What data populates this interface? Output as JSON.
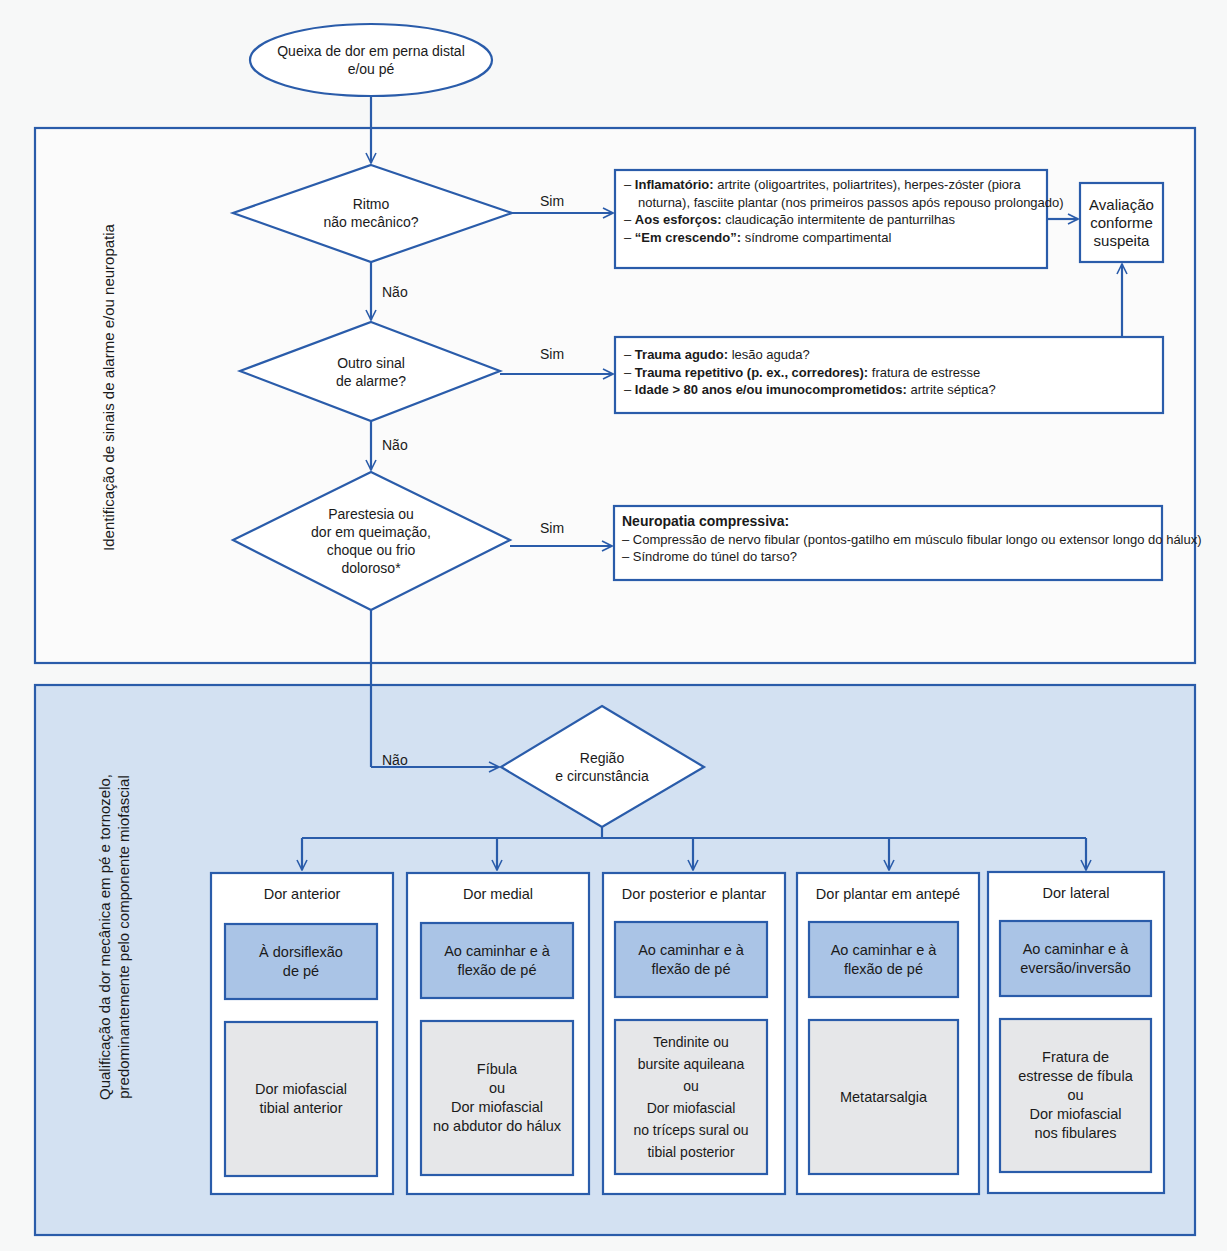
{
  "colors": {
    "line": "#2a5caa",
    "bottom_section_fill": "#d3e1f2",
    "mid_box_fill": "#aac4e6",
    "low_box_fill": "#e6e7e9",
    "background": "#f7f8f8"
  },
  "start": {
    "text_line1": "Queixa de dor em perna distal",
    "text_line2": "e/ou pé"
  },
  "alarm_section": {
    "vertical_label": "Identificação de sinais de alarme e/ou neuropatia",
    "decision1": {
      "line1": "Ritmo",
      "line2": "não mecânico?",
      "yes": "Sim",
      "no": "Não"
    },
    "result1": {
      "items": [
        {
          "bold": "Inflamatório:",
          "text": " artrite (oligoartrites, poliartrites), herpes-zóster (piora",
          "cont": "noturna), fasciite plantar (nos primeiros passos após repouso prolongado)"
        },
        {
          "bold": "Aos esforços:",
          "text": " claudicação intermitente de panturrilhas"
        },
        {
          "bold": "“Em crescendo”:",
          "text": " síndrome compartimental"
        }
      ]
    },
    "evaluation": {
      "line1": "Avaliação",
      "line2": "conforme",
      "line3": "suspeita"
    },
    "decision2": {
      "line1": "Outro sinal",
      "line2": "de alarme?",
      "yes": "Sim",
      "no": "Não"
    },
    "result2": {
      "items": [
        {
          "bold": "Trauma agudo:",
          "text": " lesão aguda?"
        },
        {
          "bold": "Trauma repetitivo (p. ex., corredores):",
          "text": " fratura de estresse"
        },
        {
          "bold": "Idade > 80 anos e/ou imunocomprometidos:",
          "text": " artrite séptica?"
        }
      ]
    },
    "decision3": {
      "line1": "Parestesia ou",
      "line2": "dor em queimação,",
      "line3": "choque ou frio",
      "line4": "doloroso*",
      "yes": "Sim",
      "no": "Não"
    },
    "result3": {
      "title": "Neuropatia compressiva:",
      "items": [
        "– Compressão de nervo fibular (pontos-gatilho em músculo fibular longo ou extensor longo do hálux)",
        "– Síndrome do túnel do tarso?"
      ]
    }
  },
  "mechanical_section": {
    "vertical_label_line1": "Qualificação da dor mecânica em pé e tornozelo,",
    "vertical_label_line2": "predominantemente pelo componente miofascial",
    "decision": {
      "line1": "Região",
      "line2": "e circunstância"
    },
    "columns": [
      {
        "title": "Dor anterior",
        "circumstance": [
          "À dorsiflexão",
          "de pé"
        ],
        "diagnosis": [
          "Dor miofascial",
          "tibial anterior"
        ]
      },
      {
        "title": "Dor medial",
        "circumstance": [
          "Ao caminhar e à",
          "flexão de pé"
        ],
        "diagnosis": [
          "Fíbula",
          "ou",
          "Dor miofascial",
          "no abdutor do hálux"
        ]
      },
      {
        "title": "Dor posterior e plantar",
        "circumstance": [
          "Ao caminhar e à",
          "flexão de pé"
        ],
        "diagnosis": [
          "Tendinite ou",
          "bursite  aquileana",
          "ou",
          "Dor miofascial",
          "no tríceps sural ou",
          "tibial posterior"
        ]
      },
      {
        "title": "Dor plantar em antepé",
        "circumstance": [
          "Ao caminhar e à",
          "flexão de pé"
        ],
        "diagnosis": [
          "Metatarsalgia"
        ]
      },
      {
        "title": "Dor lateral",
        "circumstance": [
          "Ao caminhar e à",
          "eversão/inversão"
        ],
        "diagnosis": [
          "Fratura de",
          "estresse de fíbula",
          "ou",
          "Dor miofascial",
          "nos fibulares"
        ]
      }
    ]
  }
}
